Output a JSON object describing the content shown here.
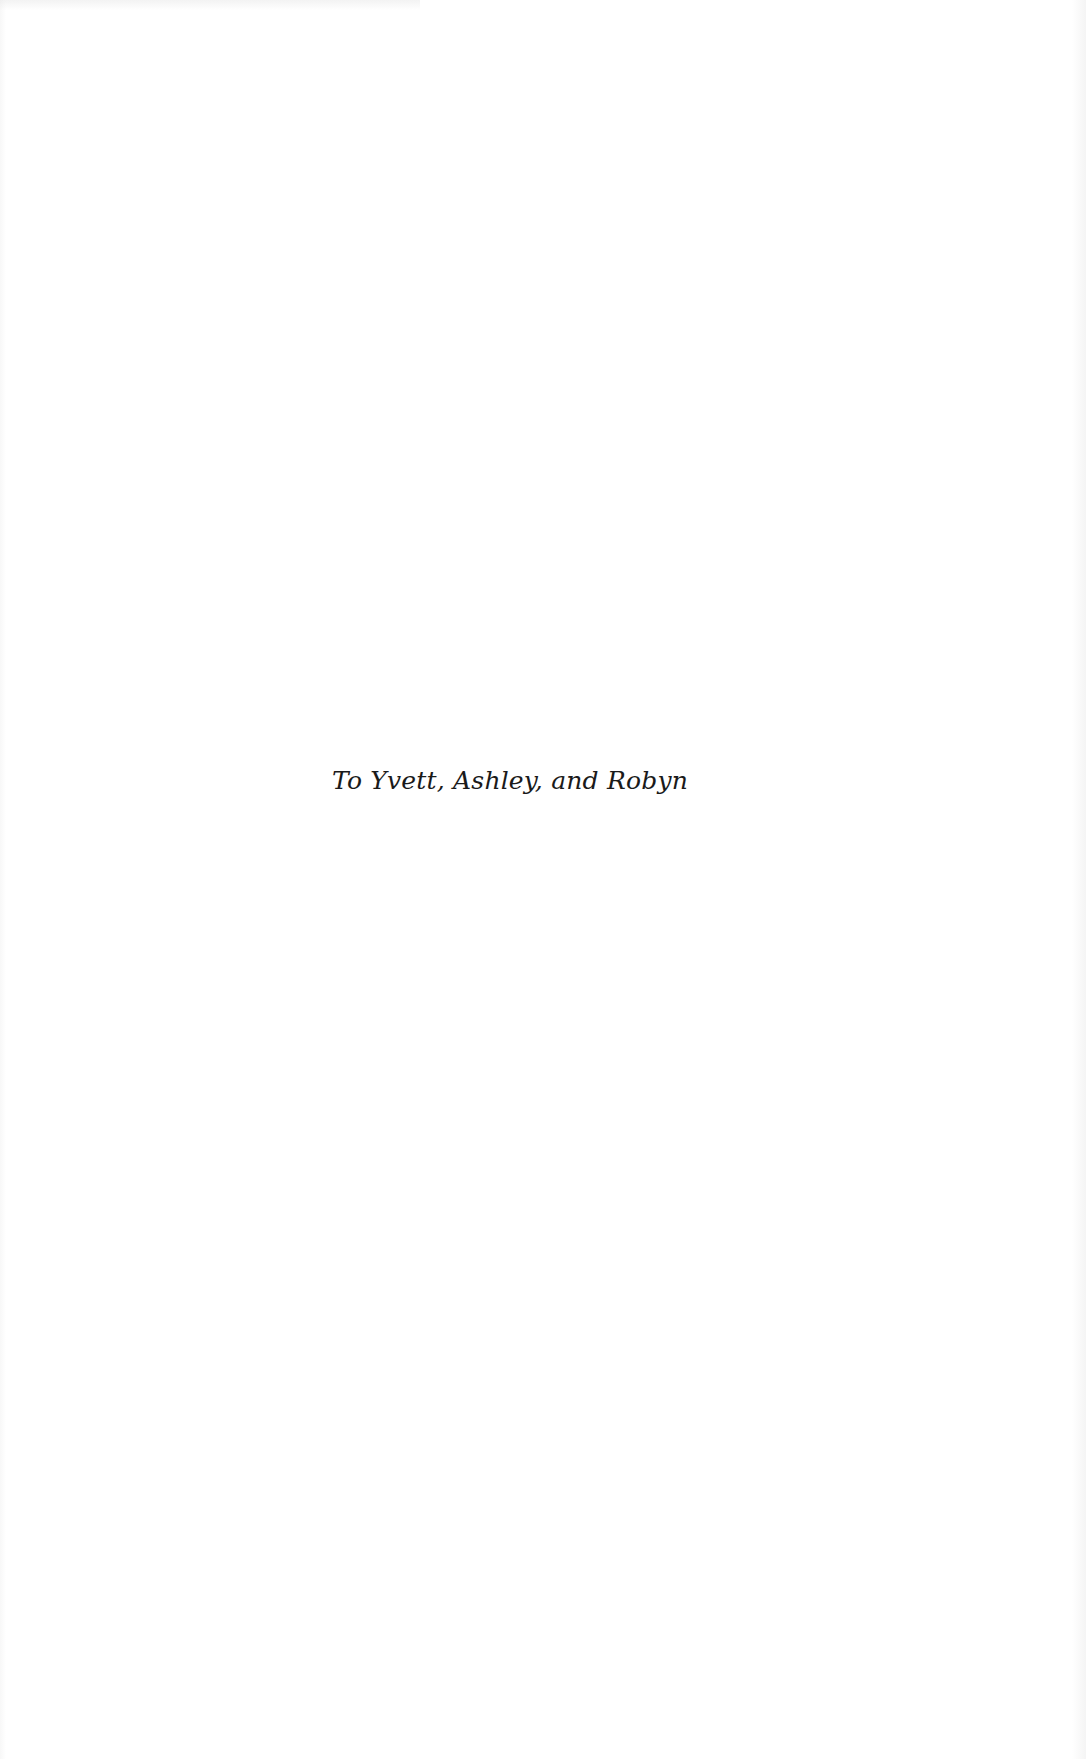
{
  "page": {
    "dedication": "To Yvett, Ashley, and Robyn"
  },
  "colors": {
    "background": "#ffffff",
    "text": "#1a1a1a"
  }
}
